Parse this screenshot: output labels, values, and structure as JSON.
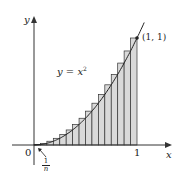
{
  "chart_data": {
    "type": "bar",
    "title": "",
    "function_label": "y = x²",
    "function": "x^2",
    "n_rectangles": 16,
    "rectangle_width_label": "1/n",
    "rectangle_type": "right-endpoint",
    "xlabel": "x",
    "ylabel": "y",
    "x_ticks": [
      "0",
      "1"
    ],
    "point_annotation": "(1, 1)",
    "xlim": [
      0,
      1
    ],
    "ylim": [
      0,
      1
    ],
    "grid": false,
    "categories": [
      0.0625,
      0.125,
      0.1875,
      0.25,
      0.3125,
      0.375,
      0.4375,
      0.5,
      0.5625,
      0.625,
      0.6875,
      0.75,
      0.8125,
      0.875,
      0.9375,
      1.0
    ],
    "values": [
      0.0039,
      0.0156,
      0.0352,
      0.0625,
      0.0977,
      0.1406,
      0.1914,
      0.25,
      0.3164,
      0.3906,
      0.4727,
      0.5625,
      0.6602,
      0.7656,
      0.8789,
      1.0
    ]
  },
  "labels": {
    "y_axis": "y",
    "x_axis": "x",
    "origin": "0",
    "x_one": "1",
    "point": "(1, 1)",
    "eq_left": "y = ",
    "eq_var": "x",
    "eq_exp": "2",
    "frac_num": "1",
    "frac_den": "n"
  },
  "colors": {
    "rect_fill": "#d9d9d9",
    "stroke": "#333333",
    "curve": "#222222"
  }
}
